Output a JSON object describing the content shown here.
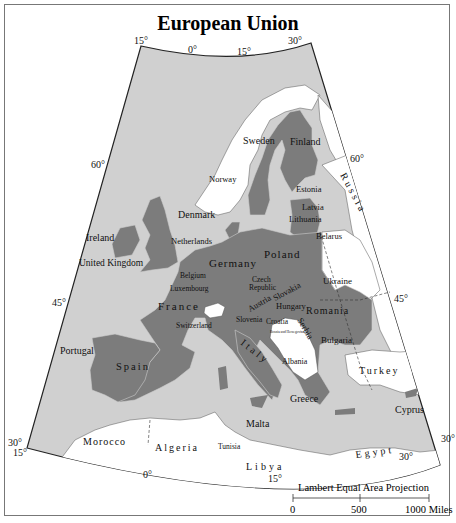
{
  "title": "European Union",
  "map": {
    "projection": "Lambert Equal Area Projection",
    "colors": {
      "sea": "#d0d0d0",
      "eu_member": "#7c7c7c",
      "non_member": "#ffffff",
      "border": "#222222"
    },
    "graticule_labels": {
      "top": [
        "15°",
        "0°",
        "15°",
        "30°"
      ],
      "left": [
        "60°",
        "45°",
        "30°",
        "15°"
      ],
      "right": [
        "60°",
        "45°",
        "30°"
      ],
      "bottom": [
        "0°",
        "15°",
        "30°"
      ]
    },
    "eu_members": [
      "Sweden",
      "Finland",
      "Estonia",
      "Latvia",
      "Lithuania",
      "Denmark",
      "Ireland",
      "United Kingdom",
      "Netherlands",
      "Belgium",
      "Luxembourg",
      "Germany",
      "Poland",
      "Czech Republic",
      "Slovakia",
      "Austria",
      "Hungary",
      "Slovenia",
      "France",
      "Portugal",
      "Spain",
      "Italy",
      "Malta",
      "Greece",
      "Romania",
      "Bulgaria",
      "Cyprus"
    ],
    "non_members": [
      "Norway",
      "Russia",
      "Belarus",
      "Ukraine",
      "Switzerland",
      "Croatia",
      "Bosnia and Herzegovina",
      "Serbia",
      "Albania",
      "Turkey",
      "Morocco",
      "Algeria",
      "Tunisia",
      "Libya",
      "Egypt"
    ],
    "labels": {
      "sweden": "Sweden",
      "finland": "Finland",
      "norway": "Norway",
      "russia": "Russia",
      "estonia": "Estonia",
      "latvia": "Latvia",
      "lithuania": "Lithuania",
      "belarus": "Belarus",
      "denmark": "Denmark",
      "ireland": "Ireland",
      "united_kingdom": "United Kingdom",
      "netherlands": "Netherlands",
      "belgium": "Belgium",
      "luxembourg": "Luxembourg",
      "germany": "Germany",
      "poland": "Poland",
      "czech": "Czech",
      "republic": "Republic",
      "slovakia": "Slovakia",
      "austria": "Austria",
      "hungary": "Hungary",
      "ukraine": "Ukraine",
      "france": "France",
      "switzerland": "Switzerland",
      "slovenia": "Slovenia",
      "croatia": "Croatia",
      "bosnia": "Bosnia and Herzegovina",
      "serbia": "Serbia",
      "romania": "Romania",
      "bulgaria": "Bulgaria",
      "albania": "Albania",
      "italy": "Italy",
      "portugal": "Portugal",
      "spain": "Spain",
      "greece": "Greece",
      "turkey": "Turkey",
      "cyprus": "Cyprus",
      "malta": "Malta",
      "morocco": "Morocco",
      "algeria": "Algeria",
      "tunisia": "Tunisia",
      "libya": "Libya",
      "egypt": "Egypt"
    }
  },
  "scale_bar": {
    "title": "Lambert Equal Area Projection",
    "ticks": [
      "0",
      "500",
      "1000 Miles"
    ]
  }
}
